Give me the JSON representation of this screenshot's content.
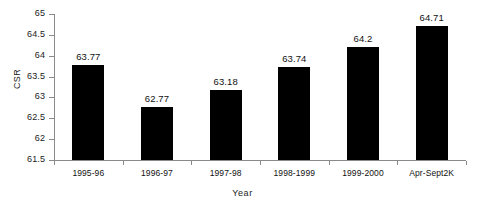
{
  "chart_data": {
    "type": "bar",
    "title": "",
    "xlabel": "Year",
    "ylabel": "CSR",
    "categories": [
      "1995-96",
      "1996-97",
      "1997-98",
      "1998-1999",
      "1999-2000",
      "Apr-Sept2K"
    ],
    "values": [
      63.77,
      62.77,
      63.18,
      63.74,
      64.2,
      64.71
    ],
    "value_labels": [
      "63.77",
      "62.77",
      "63.18",
      "63.74",
      "64.2",
      "64.71"
    ],
    "ylim": [
      61.5,
      65
    ],
    "ytick_step": 0.5,
    "ytick_labels": [
      "65",
      "64.5",
      "64",
      "63.5",
      "63",
      "62.5",
      "62",
      "61.5"
    ],
    "ytick_values": [
      65,
      64.5,
      64,
      63.5,
      63,
      62.5,
      62,
      61.5
    ],
    "grid": false,
    "legend": false,
    "bar_color": "#000000",
    "axis_color": "#8a8a8a",
    "text_color": "#111111",
    "background": "#ffffff"
  }
}
